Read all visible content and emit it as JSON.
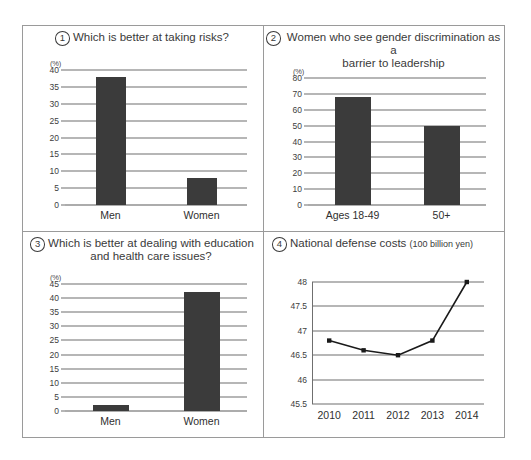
{
  "panels": [
    {
      "number": "1",
      "title": "Which is better at taking risks?",
      "title2": "",
      "unit": "(%)"
    },
    {
      "number": "2",
      "title": "Women who see gender discrimination as a",
      "title2": "barrier to leadership",
      "unit": "(%)"
    },
    {
      "number": "3",
      "title": "Which is better at dealing with education",
      "title2": "and health care issues?",
      "unit": "(%)"
    },
    {
      "number": "4",
      "title": "National defense costs",
      "title_sub": "(100 billion yen)",
      "unit": ""
    }
  ],
  "chart_data": [
    {
      "type": "bar",
      "title": "Which is better at taking risks?",
      "panel_number": "1",
      "categories": [
        "Men",
        "Women"
      ],
      "values": [
        38,
        8
      ],
      "xlabel": "",
      "ylabel": "(%)",
      "ylim": [
        0,
        40
      ],
      "yticks": [
        40,
        35,
        30,
        25,
        20,
        15,
        10,
        5,
        0
      ],
      "grid": true,
      "legend": "none",
      "bar_color": "#3b3b3b"
    },
    {
      "type": "bar",
      "title": "Women who see gender discrimination as a barrier to leadership",
      "panel_number": "2",
      "categories": [
        "Ages 18-49",
        "50+"
      ],
      "values": [
        68,
        50
      ],
      "xlabel": "",
      "ylabel": "(%)",
      "ylim": [
        0,
        80
      ],
      "yticks": [
        80,
        70,
        60,
        50,
        40,
        30,
        20,
        10,
        0
      ],
      "grid": true,
      "legend": "none",
      "bar_color": "#3b3b3b"
    },
    {
      "type": "bar",
      "title": "Which is better at dealing with education and health care issues?",
      "panel_number": "3",
      "categories": [
        "Men",
        "Women"
      ],
      "values": [
        2,
        42
      ],
      "xlabel": "",
      "ylabel": "(%)",
      "ylim": [
        0,
        45
      ],
      "yticks": [
        45,
        40,
        35,
        30,
        25,
        20,
        15,
        10,
        5,
        0
      ],
      "grid": true,
      "legend": "none",
      "bar_color": "#3b3b3b"
    },
    {
      "type": "line",
      "title": "National defense costs (100 billion yen)",
      "panel_number": "4",
      "x": [
        "2010",
        "2011",
        "2012",
        "2013",
        "2014"
      ],
      "values": [
        46.8,
        46.6,
        46.5,
        46.8,
        48.0
      ],
      "xlabel": "",
      "ylabel": "",
      "ylim": [
        45.5,
        48
      ],
      "yticks": [
        48,
        47.5,
        47,
        46.5,
        46,
        45.5
      ],
      "grid": true,
      "legend": "none",
      "line_color": "#1a1a1a",
      "marker": "square"
    }
  ]
}
